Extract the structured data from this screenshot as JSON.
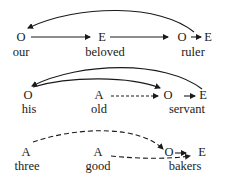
{
  "diagram": {
    "rows": [
      {
        "nodes": [
          {
            "symbol": "O",
            "word": "our"
          },
          {
            "symbol": "E",
            "word": "beloved"
          },
          {
            "symbol": "O",
            "word": "ruler"
          },
          {
            "symbol": "E",
            "word": ""
          }
        ],
        "arrows": [
          {
            "from": "our",
            "to": "beloved",
            "style": "solid"
          },
          {
            "from": "beloved",
            "to": "ruler",
            "style": "solid"
          },
          {
            "from": "ruler-O",
            "to": "ruler-E",
            "style": "solid"
          },
          {
            "from": "ruler",
            "to": "our",
            "style": "solid-curved"
          }
        ]
      },
      {
        "nodes": [
          {
            "symbol": "O",
            "word": "his"
          },
          {
            "symbol": "A",
            "word": "old"
          },
          {
            "symbol": "O",
            "word": "servant"
          },
          {
            "symbol": "E",
            "word": ""
          }
        ],
        "arrows": [
          {
            "from": "old",
            "to": "servant",
            "style": "dashed"
          },
          {
            "from": "servant-O",
            "to": "servant-E",
            "style": "solid"
          },
          {
            "from": "his",
            "to": "servant",
            "style": "solid-curved"
          },
          {
            "from": "servant",
            "to": "his",
            "style": "solid-curved"
          }
        ]
      },
      {
        "nodes": [
          {
            "symbol": "A",
            "word": "three"
          },
          {
            "symbol": "A",
            "word": "good"
          },
          {
            "symbol": "O",
            "word": "bakers"
          },
          {
            "symbol": "E",
            "word": ""
          }
        ],
        "arrows": [
          {
            "from": "three",
            "to": "bakers",
            "style": "dashed-curved"
          },
          {
            "from": "good",
            "to": "bakers",
            "style": "dashed"
          },
          {
            "from": "bakers-O",
            "to": "bakers-E",
            "style": "solid"
          }
        ]
      }
    ]
  }
}
